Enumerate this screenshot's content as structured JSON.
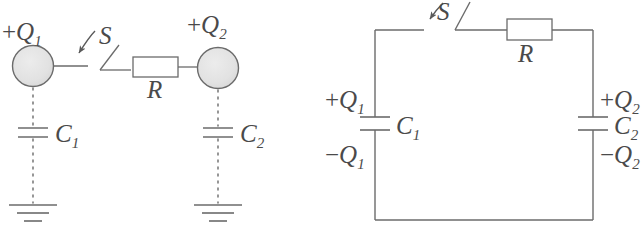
{
  "figure": {
    "type": "circuit-diagram",
    "stroke_color": "#6b6b6b",
    "text_color": "#4a4a4a",
    "sphere_fill": "#e2e2e2",
    "resistor_fill": "#ffffff",
    "background": "#ffffff"
  },
  "left_panel": {
    "name": "spheres-and-ground-representation",
    "sphere_1": {
      "label_sign": "+",
      "label_symbol": "Q",
      "label_subscript": "1"
    },
    "sphere_2": {
      "label_sign": "+",
      "label_symbol": "Q",
      "label_subscript": "2"
    },
    "switch": {
      "label": "S",
      "state": "open",
      "arrow": "pointer-arrow-to-switch"
    },
    "resistor": {
      "label": "R"
    },
    "capacitor_1": {
      "label_symbol": "C",
      "label_subscript": "1"
    },
    "capacitor_2": {
      "label_symbol": "C",
      "label_subscript": "2"
    },
    "ground_1": "earth-ground-symbol",
    "ground_2": "earth-ground-symbol"
  },
  "right_panel": {
    "name": "equivalent-loop-circuit",
    "switch": {
      "label": "S",
      "state": "open",
      "arrow": "pointer-arrow-to-switch"
    },
    "resistor": {
      "label": "R"
    },
    "capacitor_left": {
      "label_symbol": "C",
      "label_subscript": "1",
      "top_charge_sign": "+",
      "top_charge_symbol": "Q",
      "top_charge_subscript": "1",
      "bottom_charge_sign": "−",
      "bottom_charge_symbol": "Q",
      "bottom_charge_subscript": "1"
    },
    "capacitor_right": {
      "label_symbol": "C",
      "label_subscript": "2",
      "top_charge_sign": "+",
      "top_charge_symbol": "Q",
      "top_charge_subscript": "2",
      "bottom_charge_sign": "−",
      "bottom_charge_symbol": "Q",
      "bottom_charge_subscript": "2"
    }
  }
}
